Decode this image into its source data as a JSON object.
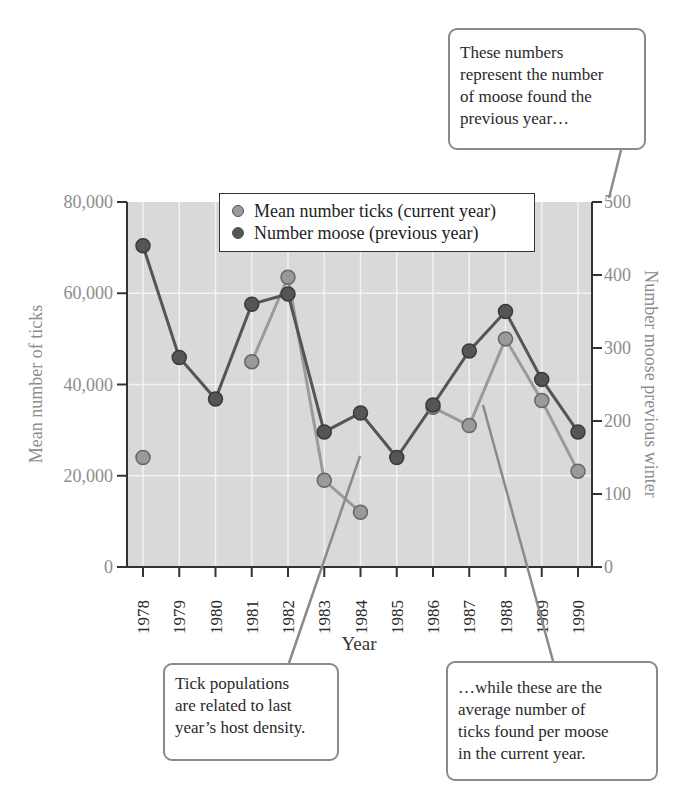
{
  "chart_data": {
    "type": "line",
    "title": "",
    "xlabel": "Year",
    "ylabel_left": "Mean number of ticks",
    "ylabel_right": "Number moose previous winter",
    "x": [
      1978,
      1979,
      1980,
      1981,
      1982,
      1983,
      1984,
      1985,
      1986,
      1987,
      1988,
      1989,
      1990
    ],
    "x_tick_labels": [
      "1978",
      "1979",
      "1980",
      "1981",
      "1982",
      "1983",
      "1984",
      "1985",
      "1986",
      "1987",
      "1988",
      "1989",
      "1990"
    ],
    "ylim_left": [
      0,
      80000
    ],
    "ylim_right": [
      0,
      500
    ],
    "y_ticks_left": [
      "0",
      "20,000",
      "40,000",
      "60,000",
      "80,000"
    ],
    "y_ticks_right": [
      "0",
      "100",
      "200",
      "300",
      "400",
      "500"
    ],
    "grid": true,
    "legend_position": "upper center",
    "series": [
      {
        "name": "Mean number ticks (current year)",
        "axis": "left",
        "color": "#9a9a9a",
        "values": [
          24000,
          null,
          null,
          45000,
          63500,
          19000,
          12000,
          null,
          35000,
          31000,
          50000,
          36500,
          21000
        ],
        "segments": [
          [
            1981,
            1982,
            1983,
            1984
          ],
          [
            1986,
            1987,
            1988,
            1989,
            1990
          ]
        ]
      },
      {
        "name": "Number moose (previous year)",
        "axis": "right",
        "color": "#555555",
        "values": [
          440,
          287,
          230,
          360,
          374,
          185,
          211,
          150,
          222,
          296,
          350,
          257,
          185
        ]
      }
    ],
    "annotations": [
      "These numbers represent the number of moose found the previous year…",
      "Tick populations are related to last year’s host density.",
      "…while these are the average number of ticks found per moose in the current year."
    ]
  },
  "legend": {
    "items": [
      {
        "label": "Mean number ticks (current year)",
        "color": "#9a9a9a"
      },
      {
        "label": "Number moose (previous year)",
        "color": "#555555"
      }
    ]
  },
  "axes": {
    "xlabel": "Year",
    "ylabel_left": "Mean number of ticks",
    "ylabel_right": "Number moose previous winter"
  },
  "callouts": {
    "top": {
      "lines": [
        "These numbers",
        "represent the number",
        "of moose found the",
        "previous year…"
      ]
    },
    "left": {
      "lines": [
        "Tick populations",
        "are related to last",
        "year’s host density."
      ]
    },
    "right": {
      "lines": [
        "…while these are the",
        "average number of",
        "ticks found per moose",
        "in the current year."
      ]
    }
  },
  "colors": {
    "plot_bg": "#d9d9d9",
    "grid": "#f2f2f2",
    "axis": "#333333",
    "tick_label_left": "#8c8c8c",
    "tick_label_right": "#8c8c8c",
    "ticks_series": "#9a9a9a",
    "moose_series": "#555555",
    "leader": "#8a8a8a"
  }
}
